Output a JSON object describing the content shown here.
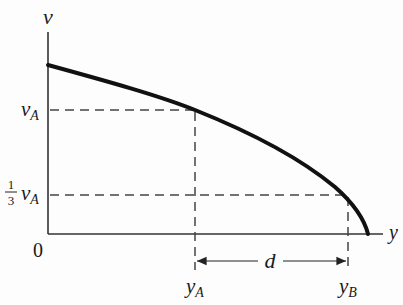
{
  "diagram": {
    "type": "velocity-distance graph",
    "axes": {
      "vertical_label": "v",
      "horizontal_label": "y",
      "origin_label": "0"
    },
    "y_ticks": {
      "vA": {
        "main": "v",
        "sub": "A"
      },
      "third_vA": {
        "frac_num": "1",
        "frac_den": "3",
        "main": "v",
        "sub": "A"
      }
    },
    "x_ticks": {
      "yA": {
        "main": "y",
        "sub": "A"
      },
      "yB": {
        "main": "y",
        "sub": "B"
      }
    },
    "dimension": {
      "label": "d",
      "from": "yA",
      "to": "yB"
    },
    "curve": {
      "description": "decreasing concave-down curve from v-intercept down to the y-axis",
      "color": "#111111"
    },
    "colors": {
      "axis": "#333333",
      "curve": "#111111",
      "dashed": "#444444"
    }
  }
}
